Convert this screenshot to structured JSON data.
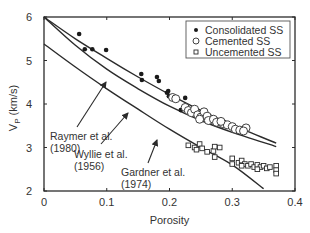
{
  "chart_data": {
    "type": "scatter",
    "title": "",
    "xlabel": "Porosity",
    "ylabel": "V_P (km/s)",
    "ylabel_main": "V",
    "ylabel_sub": "P",
    "ylabel_unit": " (km/s)",
    "xlim": [
      0,
      0.4
    ],
    "ylim": [
      2,
      6
    ],
    "xticks": [
      0,
      0.1,
      0.2,
      0.3,
      0.4
    ],
    "xtick_labels": [
      "0",
      "0.1",
      "0.2",
      "0.3",
      "0.4"
    ],
    "yticks": [
      2,
      3,
      4,
      5,
      6
    ],
    "ytick_labels": [
      "2",
      "3",
      "4",
      "5",
      "6"
    ],
    "grid": false,
    "legend_position": "upper right",
    "legend": [
      {
        "label": "Consolidated SS",
        "marker": "filled-circle"
      },
      {
        "label": "Cemented SS",
        "marker": "open-circle"
      },
      {
        "label": "Uncemented SS",
        "marker": "open-square"
      }
    ],
    "series": [
      {
        "name": "Consolidated SS",
        "marker": "filled-circle",
        "points": [
          [
            0.056,
            5.61
          ],
          [
            0.065,
            5.26
          ],
          [
            0.077,
            5.26
          ],
          [
            0.099,
            5.24
          ],
          [
            0.155,
            4.69
          ],
          [
            0.156,
            4.55
          ],
          [
            0.18,
            4.62
          ],
          [
            0.183,
            4.53
          ],
          [
            0.198,
            4.3
          ],
          [
            0.199,
            4.18
          ],
          [
            0.225,
            4.14
          ],
          [
            0.218,
            3.86
          ],
          [
            0.229,
            3.82
          ],
          [
            0.196,
            4.26
          ]
        ]
      },
      {
        "name": "Cemented SS",
        "marker": "open-circle",
        "points": [
          [
            0.205,
            4.15
          ],
          [
            0.21,
            4.12
          ],
          [
            0.225,
            3.92
          ],
          [
            0.23,
            3.85
          ],
          [
            0.235,
            3.8
          ],
          [
            0.24,
            3.88
          ],
          [
            0.245,
            3.75
          ],
          [
            0.25,
            3.7
          ],
          [
            0.255,
            3.82
          ],
          [
            0.26,
            3.72
          ],
          [
            0.262,
            3.62
          ],
          [
            0.27,
            3.65
          ],
          [
            0.275,
            3.58
          ],
          [
            0.285,
            3.55
          ],
          [
            0.292,
            3.52
          ],
          [
            0.3,
            3.48
          ],
          [
            0.305,
            3.42
          ],
          [
            0.312,
            3.4
          ],
          [
            0.322,
            3.45
          ],
          [
            0.318,
            3.38
          ],
          [
            0.248,
            3.65
          ],
          [
            0.282,
            3.6
          ]
        ]
      },
      {
        "name": "Uncemented SS",
        "marker": "open-square",
        "points": [
          [
            0.23,
            3.05
          ],
          [
            0.24,
            3.0
          ],
          [
            0.243,
            2.95
          ],
          [
            0.248,
            3.08
          ],
          [
            0.252,
            2.98
          ],
          [
            0.26,
            2.9
          ],
          [
            0.27,
            2.92
          ],
          [
            0.272,
            3.02
          ],
          [
            0.28,
            3.0
          ],
          [
            0.272,
            2.78
          ],
          [
            0.3,
            2.75
          ],
          [
            0.3,
            2.62
          ],
          [
            0.31,
            2.65
          ],
          [
            0.315,
            2.7
          ],
          [
            0.32,
            2.62
          ],
          [
            0.325,
            2.58
          ],
          [
            0.33,
            2.62
          ],
          [
            0.335,
            2.55
          ],
          [
            0.34,
            2.6
          ],
          [
            0.345,
            2.55
          ],
          [
            0.35,
            2.58
          ],
          [
            0.355,
            2.52
          ],
          [
            0.36,
            2.55
          ],
          [
            0.37,
            2.58
          ],
          [
            0.37,
            2.48
          ],
          [
            0.37,
            2.4
          ],
          [
            0.34,
            2.5
          ],
          [
            0.315,
            2.58
          ]
        ]
      }
    ],
    "curves": [
      {
        "name": "Raymer et al. (1980)",
        "label_line1": "Raymer et al.",
        "label_line2": "(1980)",
        "points": [
          [
            0,
            6.0
          ],
          [
            0.05,
            5.5
          ],
          [
            0.1,
            5.05
          ],
          [
            0.15,
            4.62
          ],
          [
            0.2,
            4.22
          ],
          [
            0.25,
            3.85
          ],
          [
            0.3,
            3.52
          ],
          [
            0.37,
            3.1
          ]
        ]
      },
      {
        "name": "Wyllie et al. (1956)",
        "label_line1": "Wyllie et al.",
        "label_line2": "(1956)",
        "points": [
          [
            0,
            6.0
          ],
          [
            0.05,
            5.35
          ],
          [
            0.1,
            4.8
          ],
          [
            0.15,
            4.35
          ],
          [
            0.2,
            3.95
          ],
          [
            0.25,
            3.62
          ],
          [
            0.3,
            3.35
          ],
          [
            0.37,
            3.02
          ]
        ]
      },
      {
        "name": "Gardner et al. (1974)",
        "label_line1": "Gardner et al.",
        "label_line2": "(1974)",
        "points": [
          [
            0,
            5.38
          ],
          [
            0.05,
            4.85
          ],
          [
            0.1,
            4.35
          ],
          [
            0.15,
            3.88
          ],
          [
            0.2,
            3.42
          ],
          [
            0.25,
            3.0
          ],
          [
            0.3,
            2.6
          ],
          [
            0.35,
            2.05
          ]
        ]
      }
    ],
    "annotations": [
      {
        "text": "Raymer et al. (1980)",
        "arrow_target": [
          0.145,
          4.78
        ]
      },
      {
        "text": "Wyllie et al. (1956)",
        "arrow_target": [
          0.19,
          3.82
        ]
      },
      {
        "text": "Gardner et al. (1974)",
        "arrow_target": [
          0.263,
          3.35
        ]
      }
    ]
  }
}
